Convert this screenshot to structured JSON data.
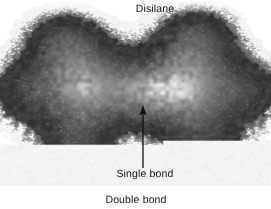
{
  "figure": {
    "title_label": "Disilane",
    "annotations": [
      {
        "id": "single-bond",
        "text": "Single bond",
        "has_leader_arrow": true
      },
      {
        "id": "double-bond",
        "text": "Double bond",
        "has_leader_arrow": false
      }
    ],
    "image_type": "electron-density-map",
    "palette": {
      "background": "#ffffff",
      "core_highlight": "#fdfdfd",
      "inner_shell": "#9c9c9c",
      "mid_shell": "#7b7b7b",
      "dense_core_ring": "#4a4a4a",
      "bonding_region": "#3d3d3d",
      "outer_halo_speckle": "#8e8e8e",
      "label_text": "#121212",
      "leader_arrow": "#111111"
    },
    "structure": {
      "atom_count": 2,
      "atom_centers": [
        {
          "x": 84,
          "y": 88
        },
        {
          "x": 188,
          "y": 88
        }
      ],
      "bond_midpoint": {
        "x": 143,
        "y": 105
      },
      "lobe_centers": [
        {
          "x": 62,
          "y": 40
        },
        {
          "x": 196,
          "y": 36
        },
        {
          "x": 74,
          "y": 150
        },
        {
          "x": 204,
          "y": 152
        },
        {
          "x": 20,
          "y": 92
        },
        {
          "x": 252,
          "y": 92
        }
      ]
    }
  }
}
